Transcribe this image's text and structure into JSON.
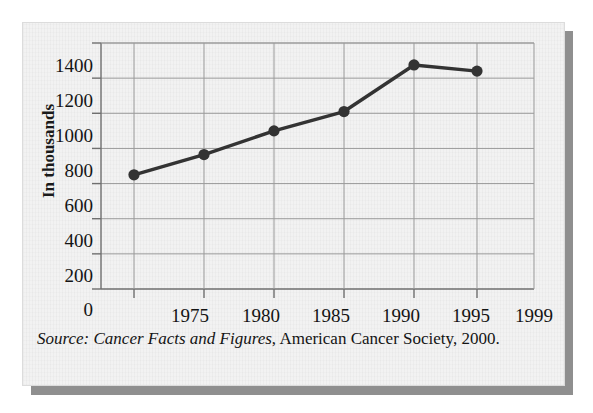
{
  "figure": {
    "panel_bg": "#f2f2f2",
    "shadow_color": "#8f8f8f"
  },
  "axes": {
    "y_title": "In thousands",
    "y_ticks": [
      "1400",
      "1200",
      "1000",
      "800",
      "600",
      "400",
      "200",
      "0"
    ],
    "x_ticks": [
      "1975",
      "1980",
      "1985",
      "1990",
      "1995",
      "1999"
    ]
  },
  "source": {
    "label": "Source:",
    "title": " Cancer Facts and Figures",
    "rest": ", American Cancer Society, 2000."
  },
  "chart_data": {
    "type": "line",
    "title": "",
    "xlabel": "",
    "ylabel": "In thousands",
    "x": [
      1975,
      1980,
      1985,
      1990,
      1995,
      1999
    ],
    "categories": [
      "1975",
      "1980",
      "1985",
      "1990",
      "1995",
      "1999"
    ],
    "values": [
      650,
      765,
      900,
      1010,
      1275,
      1240
    ],
    "ylim": [
      0,
      1400
    ],
    "yticks": [
      0,
      200,
      400,
      600,
      800,
      1000,
      1200,
      1400
    ],
    "grid": true,
    "legend": "none",
    "line_color": "#333333",
    "marker": "circle",
    "marker_color": "#333333",
    "grid_color": "#9a9a9a"
  }
}
